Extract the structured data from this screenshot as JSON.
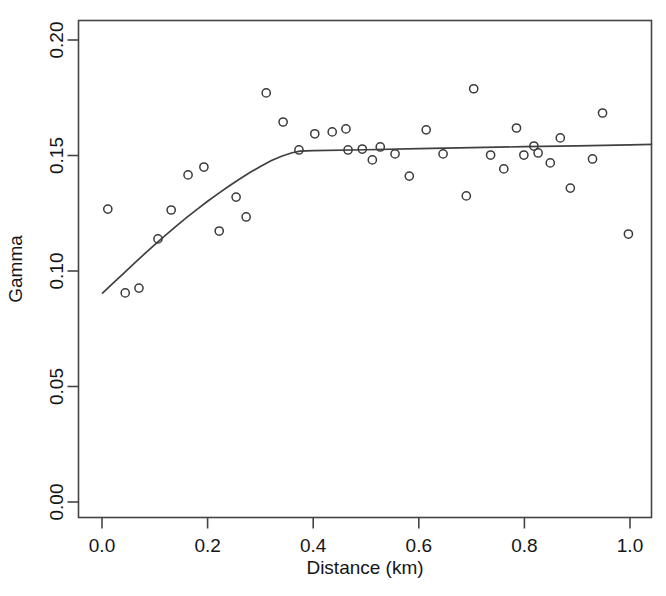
{
  "figure": {
    "background": "#ffffff",
    "foreground": "#333333",
    "point_color": "#3a3a3a",
    "line_color": "#404040"
  },
  "chart_data": {
    "type": "scatter",
    "title": "",
    "xlabel": "Distance (km)",
    "ylabel": "Gamma",
    "xlim": [
      0.0,
      1.042
    ],
    "ylim": [
      0.0,
      0.2
    ],
    "xticks": [
      0.0,
      0.2,
      0.4,
      0.6,
      0.8,
      1.0
    ],
    "xtick_labels": [
      "0.0",
      "0.2",
      "0.4",
      "0.6",
      "0.8",
      "1.0"
    ],
    "yticks": [
      0.0,
      0.05,
      0.1,
      0.15,
      0.2
    ],
    "ytick_labels": [
      "0.00",
      "0.05",
      "0.10",
      "0.15",
      "0.20"
    ],
    "grid": false,
    "legend": false,
    "marker": "open-circle",
    "series": [
      {
        "name": "Empirical variogram",
        "type": "scatter",
        "points": [
          [
            0.011,
            0.1268
          ],
          [
            0.044,
            0.0905
          ],
          [
            0.07,
            0.0926
          ],
          [
            0.106,
            0.1139
          ],
          [
            0.163,
            0.1416
          ],
          [
            0.193,
            0.145
          ],
          [
            0.131,
            0.1264
          ],
          [
            0.222,
            0.1173
          ],
          [
            0.254,
            0.132
          ],
          [
            0.273,
            0.1234
          ],
          [
            0.311,
            0.1771
          ],
          [
            0.343,
            0.1645
          ],
          [
            0.373,
            0.1524
          ],
          [
            0.403,
            0.1594
          ],
          [
            0.436,
            0.1602
          ],
          [
            0.462,
            0.1615
          ],
          [
            0.466,
            0.1524
          ],
          [
            0.493,
            0.1528
          ],
          [
            0.512,
            0.1481
          ],
          [
            0.527,
            0.1537
          ],
          [
            0.555,
            0.1507
          ],
          [
            0.582,
            0.1411
          ],
          [
            0.614,
            0.1611
          ],
          [
            0.646,
            0.1507
          ],
          [
            0.69,
            0.1325
          ],
          [
            0.704,
            0.1789
          ],
          [
            0.736,
            0.1502
          ],
          [
            0.761,
            0.1442
          ],
          [
            0.785,
            0.1619
          ],
          [
            0.799,
            0.1502
          ],
          [
            0.818,
            0.1541
          ],
          [
            0.826,
            0.1511
          ],
          [
            0.849,
            0.1468
          ],
          [
            0.868,
            0.1576
          ],
          [
            0.887,
            0.1359
          ],
          [
            0.948,
            0.1684
          ],
          [
            0.929,
            0.1485
          ],
          [
            0.997,
            0.116
          ]
        ]
      },
      {
        "name": "Fitted variogram model",
        "type": "line",
        "points": [
          [
            0.0,
            0.0902
          ],
          [
            0.02,
            0.0945
          ],
          [
            0.04,
            0.0988
          ],
          [
            0.06,
            0.1031
          ],
          [
            0.08,
            0.1073
          ],
          [
            0.1,
            0.1114
          ],
          [
            0.12,
            0.1154
          ],
          [
            0.14,
            0.1193
          ],
          [
            0.16,
            0.1231
          ],
          [
            0.18,
            0.1267
          ],
          [
            0.2,
            0.1302
          ],
          [
            0.22,
            0.1335
          ],
          [
            0.24,
            0.1367
          ],
          [
            0.26,
            0.1397
          ],
          [
            0.28,
            0.1426
          ],
          [
            0.3,
            0.1452
          ],
          [
            0.32,
            0.1477
          ],
          [
            0.34,
            0.1497
          ],
          [
            0.36,
            0.1512
          ],
          [
            0.375,
            0.1519
          ],
          [
            0.4,
            0.1521
          ],
          [
            0.5,
            0.1525
          ],
          [
            0.6,
            0.153
          ],
          [
            0.7,
            0.1534
          ],
          [
            0.8,
            0.1538
          ],
          [
            0.9,
            0.1542
          ],
          [
            1.0,
            0.1546
          ],
          [
            1.042,
            0.1548
          ]
        ]
      }
    ]
  }
}
